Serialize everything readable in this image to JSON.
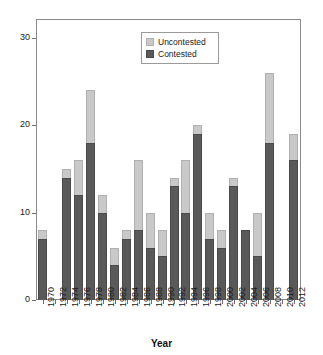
{
  "chart_data": {
    "type": "bar",
    "stacked": true,
    "title": "",
    "xlabel": "Year",
    "ylabel": "",
    "ylim": [
      0,
      32
    ],
    "yticks": [
      0,
      10,
      20,
      30
    ],
    "grid": false,
    "legend_position": "top-center",
    "colors": {
      "Uncontested": "#c9c9c9",
      "Contested": "#595959",
      "axis": "#6e6e6e",
      "background": "#ffffff"
    },
    "categories": [
      "1970",
      "1972",
      "1974",
      "1976",
      "1978",
      "1980",
      "1982",
      "1984",
      "1986",
      "1988",
      "1990",
      "1992",
      "1994",
      "1996",
      "1998",
      "2000",
      "2002",
      "2004",
      "2006",
      "2008",
      "2010",
      "2012"
    ],
    "series": [
      {
        "name": "Contested",
        "values": [
          7,
          0,
          14,
          12,
          18,
          10,
          4,
          7,
          8,
          6,
          5,
          13,
          10,
          19,
          7,
          6,
          13,
          8,
          5,
          18,
          0,
          16
        ]
      },
      {
        "name": "Uncontested",
        "values": [
          1,
          0,
          1,
          4,
          6,
          2,
          2,
          1,
          8,
          4,
          3,
          1,
          6,
          1,
          3,
          2,
          1,
          0,
          5,
          8,
          0,
          3
        ]
      }
    ],
    "totals": [
      8,
      0,
      15,
      16,
      24,
      12,
      6,
      8,
      16,
      10,
      8,
      14,
      16,
      20,
      10,
      8,
      14,
      8,
      10,
      26,
      0,
      19
    ]
  },
  "legend": {
    "entries": [
      {
        "label": "Uncontested",
        "swatch": "light"
      },
      {
        "label": "Contested",
        "swatch": "dark"
      }
    ]
  },
  "axis": {
    "x_title": "Year"
  }
}
